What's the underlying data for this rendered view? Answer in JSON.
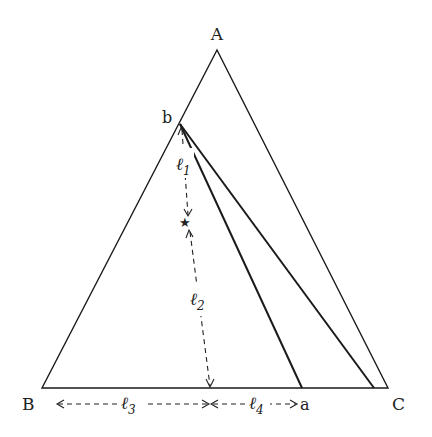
{
  "diagram": {
    "type": "triangle-geometry",
    "vertices": {
      "A": "A",
      "B": "B",
      "C": "C"
    },
    "points": {
      "b": "b",
      "a": "a",
      "star": "★"
    },
    "segment_labels": {
      "l1": "ℓ",
      "l1_sub": "1",
      "l2": "ℓ",
      "l2_sub": "2",
      "l3": "ℓ",
      "l3_sub": "3",
      "l4": "ℓ",
      "l4_sub": "4"
    },
    "lines": [
      {
        "from": "b",
        "to": "a",
        "style": "solid"
      },
      {
        "from": "b",
        "to": "near-C",
        "style": "solid"
      }
    ],
    "measurements": [
      {
        "label": "ℓ1",
        "from": "b",
        "to": "star",
        "style": "dashed-arrow"
      },
      {
        "label": "ℓ2",
        "from": "star",
        "to": "base",
        "style": "dashed-arrow"
      },
      {
        "label": "ℓ3",
        "from": "B",
        "to": "foot",
        "style": "dashed-arrow"
      },
      {
        "label": "ℓ4",
        "from": "foot",
        "to": "a",
        "style": "dashed-arrow"
      }
    ]
  }
}
